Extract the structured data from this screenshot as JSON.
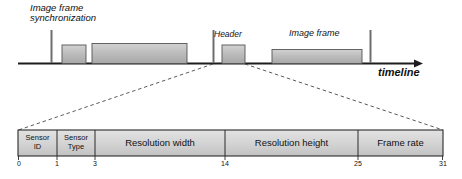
{
  "figure": {
    "title_absent": true,
    "timeline": {
      "axis_label": "timeline",
      "sync_label_line1": "Image frame",
      "sync_label_line2": "synchronization",
      "header_label": "Header",
      "image_frame_label": "Image frame",
      "ticks": [
        {
          "name": "sync-tick-1",
          "x": 51
        },
        {
          "name": "sync-tick-2",
          "x": 213
        },
        {
          "name": "sync-tick-3",
          "x": 370
        }
      ],
      "blocks": [
        {
          "name": "header-block-1",
          "x": 62,
          "width": 24,
          "height": 18
        },
        {
          "name": "image-frame-block-1",
          "x": 92,
          "width": 95,
          "height": 20
        },
        {
          "name": "header-block-2",
          "x": 222,
          "width": 23,
          "height": 18
        },
        {
          "name": "image-frame-block-2",
          "x": 272,
          "width": 90,
          "height": 14
        }
      ]
    },
    "header_format": {
      "fields": [
        {
          "name": "sensor-id",
          "label_line1": "Sensor",
          "label_line2": "ID",
          "start_bit": "0",
          "x": 18,
          "width": 39
        },
        {
          "name": "sensor-type",
          "label_line1": "Sensor",
          "label_line2": "Type",
          "start_bit": "1",
          "x": 57,
          "width": 38
        },
        {
          "name": "resolution-width",
          "label_line1": "Resolution width",
          "label_line2": "",
          "start_bit": "3",
          "x": 95,
          "width": 130
        },
        {
          "name": "resolution-height",
          "label_line1": "Resolution height",
          "label_line2": "",
          "start_bit": "14",
          "x": 225,
          "width": 133
        },
        {
          "name": "frame-rate",
          "label_line1": "Frame rate",
          "label_line2": "",
          "start_bit": "25",
          "x": 358,
          "width": 85
        }
      ],
      "end_bit": "31"
    },
    "colors": {
      "block_fill": "#b9b9b9",
      "block_fill_light": "#c9c9c9",
      "cell_fill": "#d6d6d6",
      "stroke": "#2b2b2b",
      "dashed": "#555555"
    }
  }
}
